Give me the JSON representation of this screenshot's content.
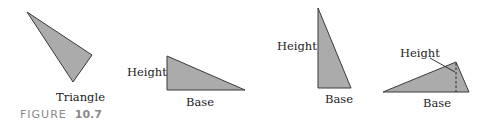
{
  "figure": {
    "caption_prefix": "FIGURE",
    "caption_number": "10.7"
  },
  "triangles": [
    {
      "id": "triangle-general",
      "label": "Triangle"
    },
    {
      "id": "triangle-right-wide",
      "height_label": "Height",
      "base_label": "Base"
    },
    {
      "id": "triangle-right-tall",
      "height_label": "Height",
      "base_label": "Base"
    },
    {
      "id": "triangle-obtuse",
      "height_label": "Height",
      "base_label": "Base"
    }
  ],
  "colors": {
    "fill": "#ababab",
    "stroke": "#3a3a3a",
    "caption": "#8a8a8a"
  }
}
